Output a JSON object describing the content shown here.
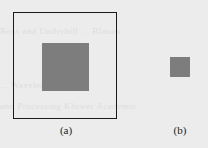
{
  "figure": {
    "panels": [
      {
        "id": "a",
        "label": "(a)",
        "has_frame": true,
        "frame_color": "#1a1a1a",
        "square_color": "#7d7d7d"
      },
      {
        "id": "b",
        "label": "(b)",
        "has_frame": false,
        "square_color": "#7d7d7d"
      }
    ]
  },
  "background_bleed_text": [
    "Ross and Underhill ... Blatow",
    "... Wavelet ...",
    "and Processing Kluwer Academic"
  ]
}
